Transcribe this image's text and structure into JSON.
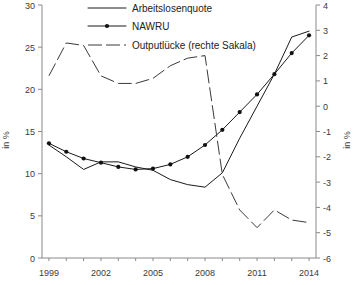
{
  "chart_data": {
    "type": "line",
    "title": "",
    "xlabel": "",
    "ylabel": "in %",
    "ylabel_right": "in %",
    "x": [
      1999,
      2000,
      2001,
      2002,
      2003,
      2004,
      2005,
      2006,
      2007,
      2008,
      2009,
      2010,
      2011,
      2012,
      2013,
      2014
    ],
    "xticks": [
      1999,
      2002,
      2005,
      2008,
      2011,
      2014
    ],
    "xtick_labels": [
      "1999",
      "2002",
      "2005",
      "2008",
      "2011",
      "2014"
    ],
    "xlim": [
      1998.6,
      2014.4
    ],
    "ylim": [
      0,
      30
    ],
    "yticks": [
      0,
      5,
      10,
      15,
      20,
      25,
      30
    ],
    "ytick_labels": [
      "0",
      "5",
      "10",
      "15",
      "20",
      "25",
      "30"
    ],
    "ylim_right": [
      -6,
      4
    ],
    "yticks_right": [
      -6,
      -5,
      -4,
      -3,
      -2,
      -1,
      0,
      1,
      2,
      3,
      4
    ],
    "ytick_labels_right": [
      "-6",
      "-5",
      "-4",
      "-3",
      "-2",
      "-1",
      "0",
      "1",
      "2",
      "3",
      "4"
    ],
    "grid": false,
    "legend_position": "top-center",
    "series": [
      {
        "name": "Arbeitslosenquote",
        "axis": "left",
        "style": "solid",
        "markers": false,
        "values": [
          13.4,
          12.0,
          10.5,
          11.4,
          11.4,
          10.8,
          10.4,
          9.3,
          8.7,
          8.4,
          10.1,
          14.2,
          18.0,
          21.8,
          26.2,
          26.9
        ]
      },
      {
        "name": "NAWRU",
        "axis": "left",
        "style": "solid",
        "markers": true,
        "values": [
          13.6,
          12.6,
          11.8,
          11.3,
          10.8,
          10.5,
          10.6,
          11.1,
          12.0,
          13.4,
          15.2,
          17.3,
          19.4,
          21.8,
          24.3,
          26.4
        ]
      },
      {
        "name": "Outputlücke (rechte Sakala)",
        "axis": "right",
        "style": "dashed",
        "markers": false,
        "values": [
          1.2,
          2.5,
          2.4,
          1.2,
          0.9,
          0.9,
          1.1,
          1.6,
          1.9,
          2.0,
          -2.7,
          -4.1,
          -4.8,
          -4.1,
          -4.5,
          -4.6
        ]
      }
    ],
    "legend": [
      {
        "label": "Arbeitslosenquote",
        "style": "solid",
        "marker": false
      },
      {
        "label": "NAWRU",
        "style": "solid",
        "marker": true
      },
      {
        "label": "Outputlücke (rechte Sakala)",
        "style": "dashed",
        "marker": false
      }
    ]
  }
}
